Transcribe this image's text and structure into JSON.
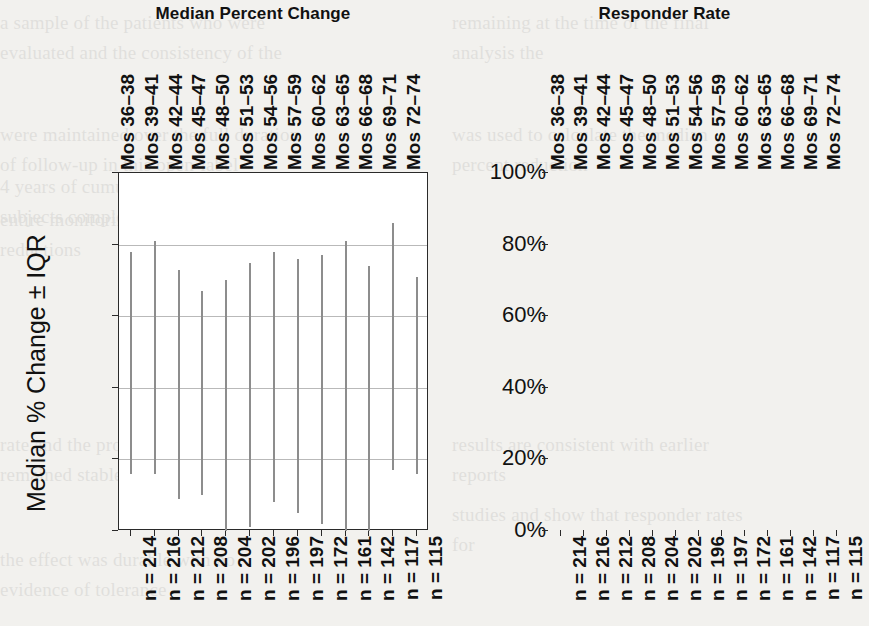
{
  "figure": {
    "background": "#f2f1ee",
    "axis_color": "#2a2a2a",
    "grid_color": "#b9b9b9",
    "mark_color": "#101010",
    "whisker_color": "#8d8d8d"
  },
  "panels": [
    {
      "key": "median_percent_change",
      "title": "Median Percent Change",
      "ylabel": "Median % Change ± IQR",
      "yticks": [
        "-100%",
        "-80%",
        "-60%",
        "-40%",
        "-20%",
        "0%"
      ]
    },
    {
      "key": "responder_rate",
      "title": "Responder Rate",
      "ylabel": "Responder Rate ± 95% CIs",
      "yticks": [
        "100%",
        "80%",
        "60%",
        "40%",
        "20%",
        "0%"
      ]
    }
  ],
  "categories": [
    "Mos 36–38",
    "Mos 39–41",
    "Mos 42–44",
    "Mos 45–47",
    "Mos 48–50",
    "Mos 51–53",
    "Mos 54–56",
    "Mos 57–59",
    "Mos 60–62",
    "Mos 63–65",
    "Mos 66–68",
    "Mos 69–71",
    "Mos 72–74"
  ],
  "n_labels": [
    "n = 214",
    "n = 216",
    "n = 212",
    "n = 208",
    "n = 204",
    "n = 202",
    "n = 196",
    "n = 197",
    "n = 172",
    "n = 161",
    "n = 142",
    "n = 117",
    "n = 115"
  ],
  "chart_data": [
    {
      "type": "bar",
      "title": "Median Percent Change",
      "xlabel": "",
      "ylabel": "Median % Change ± IQR",
      "ylim": [
        -100,
        0
      ],
      "yticks": [
        -100,
        -80,
        -60,
        -40,
        -20,
        0
      ],
      "ytick_labels": [
        "-100%",
        "-80%",
        "-60%",
        "-40%",
        "-20%",
        "0%"
      ],
      "grid": true,
      "legend": "none",
      "categories": [
        "Mos 36–38",
        "Mos 39–41",
        "Mos 42–44",
        "Mos 45–47",
        "Mos 48–50",
        "Mos 51–53",
        "Mos 54–56",
        "Mos 57–59",
        "Mos 60–62",
        "Mos 63–65",
        "Mos 66–68",
        "Mos 69–71",
        "Mos 72–74"
      ],
      "n": [
        214,
        216,
        212,
        208,
        204,
        202,
        196,
        197,
        172,
        161,
        142,
        117,
        115
      ],
      "values": [
        -60,
        -57,
        -63,
        -67,
        -64,
        -63,
        -65,
        -62,
        -66,
        -61,
        -62,
        -50,
        -66
      ],
      "iqr_upper": [
        -22,
        -19,
        -27,
        -33,
        -30,
        -25,
        -22,
        -24,
        -23,
        -19,
        -26,
        -14,
        -29
      ],
      "iqr_lower": [
        -84,
        -84,
        -91,
        -90,
        -100,
        -99,
        -92,
        -95,
        -98,
        -100,
        -100,
        -83,
        -84
      ]
    },
    {
      "type": "scatter",
      "title": "Responder Rate",
      "xlabel": "",
      "ylabel": "Responder Rate ± 95% CIs",
      "ylim": [
        0,
        100
      ],
      "yticks": [
        0,
        20,
        40,
        60,
        80,
        100
      ],
      "ytick_labels": [
        "0%",
        "20%",
        "40%",
        "60%",
        "80%",
        "100%"
      ],
      "grid": true,
      "legend": "none",
      "categories": [
        "Mos 36–38",
        "Mos 39–41",
        "Mos 42–44",
        "Mos 45–47",
        "Mos 48–50",
        "Mos 51–53",
        "Mos 54–56",
        "Mos 57–59",
        "Mos 60–62",
        "Mos 63–65",
        "Mos 66–68",
        "Mos 69–71",
        "Mos 72–74"
      ],
      "n": [
        214,
        216,
        212,
        208,
        204,
        202,
        196,
        197,
        172,
        161,
        142,
        117,
        115
      ],
      "values": [
        57.5,
        55.5,
        60,
        60.5,
        60.5,
        62,
        60.5,
        61,
        60.5,
        60.5,
        59.5,
        49,
        58.5
      ],
      "ci_upper": [
        64,
        62,
        66.5,
        66.5,
        66.5,
        68.5,
        67,
        67.5,
        67.5,
        68,
        67,
        57.5,
        67
      ],
      "ci_lower": [
        51,
        48.5,
        53.5,
        54,
        54,
        55.5,
        54,
        54.5,
        54,
        53.5,
        52,
        40.5,
        50
      ]
    }
  ],
  "ghost_text": {
    "columns": [
      {
        "x": 0,
        "y": 8,
        "text": "a sample of the patients who were evaluated and the consistency of the"
      },
      {
        "x": 0,
        "y": 120,
        "text": "were maintained over the full duration of follow-up in this open-label"
      },
      {
        "x": 0,
        "y": 172,
        "text": "4 years of cumulative exposure. 17 subjects completed the"
      },
      {
        "x": 0,
        "y": 205,
        "text": "entire monitoring period and the mean reductions"
      },
      {
        "x": 0,
        "y": 430,
        "text": "rate and the proportion of responders remained stable"
      },
      {
        "x": 0,
        "y": 545,
        "text": "the effect was durable with no evidence of tolerance"
      },
      {
        "x": 452,
        "y": 8,
        "text": "remaining at the time of the final analysis the"
      },
      {
        "x": 452,
        "y": 120,
        "text": "was used to calculate the median percent reduction"
      },
      {
        "x": 452,
        "y": 430,
        "text": "results are consistent with earlier reports"
      },
      {
        "x": 452,
        "y": 500,
        "text": "studies and show that responder rates for"
      }
    ]
  }
}
